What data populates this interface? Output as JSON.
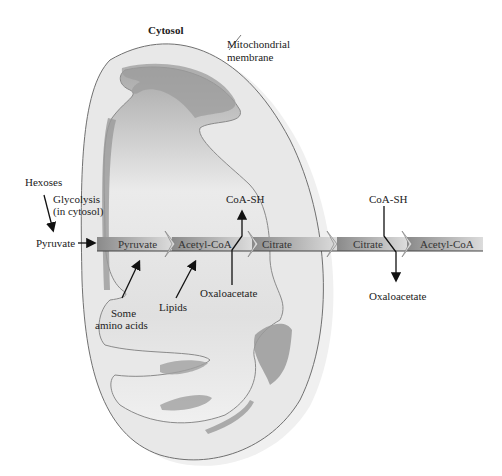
{
  "diagram": {
    "title": "Cytosol",
    "membrane_label": [
      "Mitochondrial",
      "membrane"
    ],
    "inputs": {
      "hexoses": "Hexoses",
      "glycolysis": [
        "Glycolysis",
        "(in cytosol)"
      ],
      "pyruvate_outside": "Pyruvate",
      "amino_acids": [
        "Some",
        "amino acids"
      ],
      "lipids": "Lipids"
    },
    "bar_segments": [
      {
        "label": "Pyruvate"
      },
      {
        "label": "Acetyl-CoA"
      },
      {
        "label": "Citrate"
      },
      {
        "label": "Citrate"
      },
      {
        "label": "Acetyl-CoA"
      }
    ],
    "side_products": {
      "coash_inside": "CoA-SH",
      "oxaloacetate_inside": "Oxaloacetate",
      "coash_outside": "CoA-SH",
      "oxaloacetate_outside": "Oxaloacetate"
    },
    "colors": {
      "membrane_fill": "#e6e6e6",
      "matrix_fill": "#d4d4d4",
      "crista_fill": "#9a9a9a",
      "bar_dark": "#8e8e8e",
      "bar_light": "#d8d8d8"
    }
  }
}
